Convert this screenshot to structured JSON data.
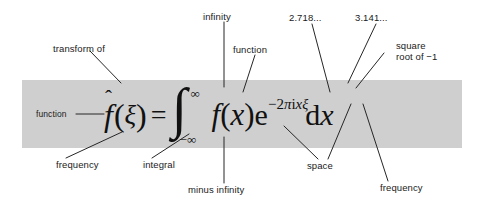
{
  "figure": {
    "kind": "annotated-equation-diagram",
    "band_color": "#cfcfcf",
    "background_color": "#ffffff",
    "text_color": "#1a1a1a"
  },
  "equation": {
    "plain": "f̂(ξ) = ∫_{-∞}^{∞} f(x) e^{-2πixξ} dx",
    "lhs": {
      "function_symbol": "f",
      "hat": "ˆ",
      "open_paren": "(",
      "variable": "ξ",
      "close_paren": ")"
    },
    "equals": "=",
    "integral": {
      "sign": "∫",
      "upper_limit": "∞",
      "lower_limit": "−∞"
    },
    "integrand": {
      "function_symbol": "f",
      "open_paren": "(",
      "variable": "x",
      "close_paren": ")",
      "exponential_base": "e",
      "exponent": {
        "minus": "−",
        "two": "2",
        "pi": "π",
        "i": "i",
        "x": "x",
        "xi": "ξ"
      }
    },
    "differential": {
      "d": "d",
      "variable": "x"
    }
  },
  "annotations": [
    {
      "id": "transform-of",
      "text": "transform of",
      "position": "top-left"
    },
    {
      "id": "infinity",
      "text": "infinity",
      "position": "top-center"
    },
    {
      "id": "function-top",
      "text": "function",
      "position": "top-center-right"
    },
    {
      "id": "e-constant",
      "text": "2.718...",
      "position": "top-right"
    },
    {
      "id": "pi-constant",
      "text": "3.141...",
      "position": "top-right"
    },
    {
      "id": "sqrt-minus-one",
      "line1": "square",
      "line2": "root of −1",
      "text": "square root of −1",
      "position": "top-far-right"
    },
    {
      "id": "function-left",
      "text": "function",
      "position": "inside-band-left"
    },
    {
      "id": "frequency-left",
      "text": "frequency",
      "position": "bottom-left"
    },
    {
      "id": "integral",
      "text": "integral",
      "position": "bottom-left-center"
    },
    {
      "id": "minus-infinity",
      "text": "minus infinity",
      "position": "bottom-center"
    },
    {
      "id": "space",
      "text": "space",
      "position": "bottom-right-center"
    },
    {
      "id": "frequency-right",
      "text": "frequency",
      "position": "bottom-far-right"
    }
  ]
}
